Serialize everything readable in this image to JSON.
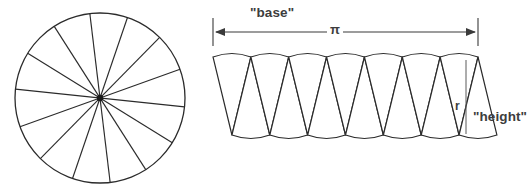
{
  "figure": {
    "background_color": "#ffffff",
    "line_color": "#2b2b2b",
    "label_color": "#3d3d3d"
  },
  "labels": {
    "base": "\"base\"",
    "pi": "π",
    "radius": "r",
    "height": "\"height\""
  },
  "chart_data": {
    "type": "diagram",
    "title": "",
    "panels": [
      {
        "name": "sector-circle",
        "shape": "circle",
        "center": {
          "x": 100,
          "y": 98
        },
        "radius": 85,
        "sector_count": 14,
        "diameter_line_count": 7,
        "sector_angle_degrees": 25.714,
        "start_angle_degrees": 6,
        "center_dot_radius": 3.2,
        "fill": "#ffffff",
        "stroke": "#2b2b2b"
      },
      {
        "name": "triangle-strip",
        "shape": "alternating-triangle-strip",
        "left_x": 213,
        "right_x": 478,
        "top_y": 57,
        "bottom_y": 135,
        "triangle_count": 14,
        "up_triangle_count": 7,
        "down_triangle_count": 7,
        "strip_height": 78,
        "arc_bulge": 3.5,
        "fill": "#ffffff",
        "stroke": "#2b2b2b"
      }
    ],
    "annotations": [
      {
        "name": "base-dimension",
        "text": "\"base\"",
        "value_symbol": "π",
        "kind": "double-arrow-dimension",
        "y": 32,
        "x_start": 213,
        "x_end": 478,
        "tick_top": 18,
        "tick_bottom": 46,
        "arrow_style": "both-ends"
      },
      {
        "name": "radius-leader",
        "text": "r",
        "kind": "vertical-segment",
        "x": 466,
        "y_top": 62,
        "y_bottom": 133
      },
      {
        "name": "height-label",
        "text": "\"height\"",
        "kind": "text-only",
        "x": 473,
        "y": 110
      }
    ],
    "axis_ranges": {
      "x": [
        0,
        530
      ],
      "y": [
        0,
        189
      ]
    },
    "grid": false,
    "legend": "none"
  }
}
